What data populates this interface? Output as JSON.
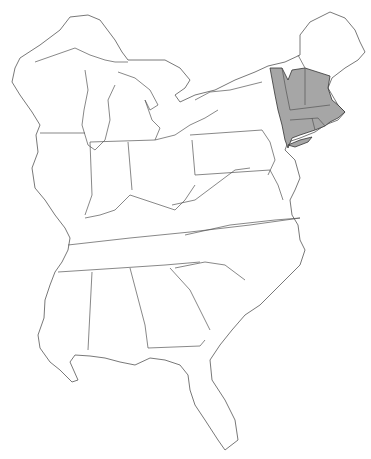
{
  "map": {
    "title": "",
    "region": "Eastern United States",
    "colors": {
      "land": "#ffffff",
      "outline": "#555555",
      "highlight": "#a6a6a6",
      "background": "#ffffff"
    },
    "highlighted_region": [
      "Eastern New York strip",
      "Vermont",
      "New Hampshire (southern)",
      "Massachusetts",
      "Connecticut",
      "Rhode Island",
      "Long Island"
    ],
    "states": [
      "Wisconsin",
      "Michigan",
      "Illinois",
      "Indiana",
      "Ohio",
      "Kentucky",
      "Tennessee",
      "Mississippi",
      "Alabama",
      "Georgia",
      "Florida",
      "South Carolina",
      "North Carolina",
      "Virginia",
      "West Virginia",
      "Maryland",
      "Delaware",
      "New Jersey",
      "Pennsylvania",
      "New York",
      "Vermont",
      "New Hampshire",
      "Maine",
      "Massachusetts",
      "Connecticut",
      "Rhode Island"
    ]
  }
}
